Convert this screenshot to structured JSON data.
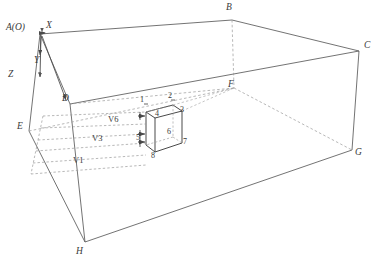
{
  "figure": {
    "line_color": "#5a5a5a",
    "dash_color": "#8e8e8e",
    "text_color": "#3a3a3a",
    "background": "#ffffff"
  },
  "axes": {
    "origin_label": "A(O)",
    "x_label": "X",
    "y_label": "Y",
    "z_label": "Z"
  },
  "domain": {
    "vertices": [
      {
        "id": "A",
        "label": "A(O)",
        "x": 40,
        "y": 30,
        "hidden": false
      },
      {
        "id": "B",
        "label": "B",
        "x": 232,
        "y": 13,
        "hidden": false
      },
      {
        "id": "C",
        "label": "C",
        "x": 364,
        "y": 48,
        "hidden": false
      },
      {
        "id": "D",
        "label": "D",
        "x": 70,
        "y": 100,
        "hidden": false
      },
      {
        "id": "E",
        "label": "E",
        "x": 24,
        "y": 128,
        "hidden": false
      },
      {
        "id": "F",
        "label": "F",
        "x": 234,
        "y": 85,
        "hidden": true
      },
      {
        "id": "G",
        "label": "G",
        "x": 352,
        "y": 155,
        "hidden": false
      },
      {
        "id": "H",
        "label": "H",
        "x": 81,
        "y": 247,
        "hidden": false
      }
    ]
  },
  "cube": {
    "vertex_labels": [
      "1",
      "2",
      "3",
      "4",
      "5",
      "6",
      "7",
      "8"
    ],
    "hidden_vertex": "6",
    "description": "small cube (obstacle) placed inside the domain"
  },
  "velocities": [
    {
      "label": "V6",
      "row": 1
    },
    {
      "label": "V3",
      "row": 2
    },
    {
      "label": "V1",
      "row": 3
    }
  ]
}
